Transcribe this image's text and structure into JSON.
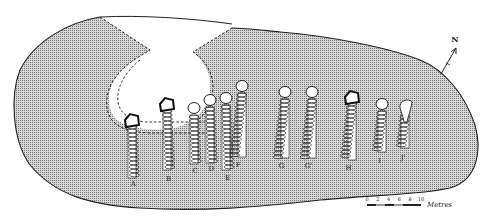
{
  "figure": {
    "type": "archaeological site plan",
    "colors": {
      "ground_fill": "#c9c9c9",
      "stipple_dot": "#7a7a7a",
      "outline": "#222222",
      "cavity": "#ffffff"
    }
  },
  "graves": [
    {
      "id": "A",
      "label": "A",
      "x": 132,
      "top": 118,
      "bottom": 178,
      "label_y": 186,
      "head": "square"
    },
    {
      "id": "B",
      "label": "B",
      "x": 167,
      "top": 102,
      "bottom": 170,
      "label_y": 181,
      "head": "square"
    },
    {
      "id": "C",
      "label": "C",
      "x": 194,
      "top": 108,
      "bottom": 164,
      "label_y": 173,
      "head": "round"
    },
    {
      "id": "D",
      "label": "D",
      "x": 210,
      "top": 100,
      "bottom": 163,
      "label_y": 171,
      "head": "round"
    },
    {
      "id": "E",
      "label": "E",
      "x": 226,
      "top": 98,
      "bottom": 170,
      "label_y": 180,
      "head": "round"
    },
    {
      "id": "F",
      "label": "F",
      "x": 242,
      "top": 86,
      "bottom": 157,
      "label_y": 167,
      "head": "round"
    },
    {
      "id": "G",
      "label": "G",
      "x": 285,
      "top": 92,
      "bottom": 158,
      "label_y": 168,
      "head": "round"
    },
    {
      "id": "G'",
      "label": "G'",
      "x": 312,
      "top": 92,
      "bottom": 158,
      "label_y": 168,
      "head": "round"
    },
    {
      "id": "H",
      "label": "H",
      "x": 352,
      "top": 95,
      "bottom": 160,
      "label_y": 170,
      "head": "square"
    },
    {
      "id": "I",
      "label": "I",
      "x": 382,
      "top": 104,
      "bottom": 152,
      "label_y": 163,
      "head": "round"
    },
    {
      "id": "J",
      "label": "J'",
      "x": 405,
      "top": 108,
      "bottom": 148,
      "label_y": 160,
      "head": "flared"
    }
  ],
  "north_arrow": {
    "label": "N"
  },
  "scale_bar": {
    "ticks": [
      "0",
      "2",
      "4",
      "6",
      "8",
      "10"
    ],
    "unit": "Metres"
  }
}
